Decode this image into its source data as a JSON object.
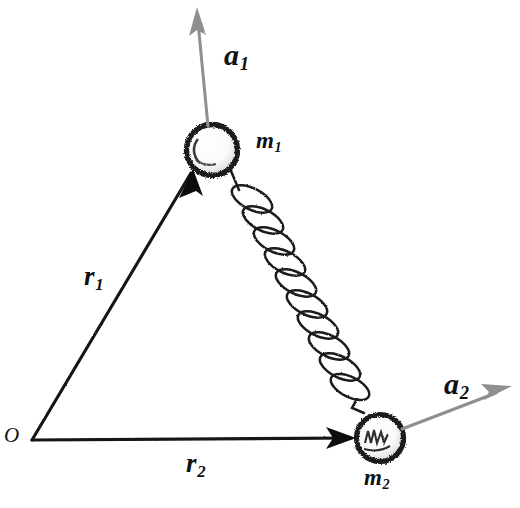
{
  "diagram": {
    "style": "hand-drawn pencil sketch",
    "background_color": "#ffffff",
    "ink_color": "#111111",
    "vector_gray": "#8c8c8c",
    "labels": {
      "origin": "O",
      "mass1": "m",
      "mass1_sub": "1",
      "mass2": "m",
      "mass2_sub": "2",
      "position1": "r",
      "position1_sub": "1",
      "position2": "r",
      "position2_sub": "2",
      "accel1": "a",
      "accel1_sub": "1",
      "accel2": "a",
      "accel2_sub": "2"
    },
    "elements": [
      {
        "name": "origin-point",
        "kind": "point",
        "x": 32,
        "y": 440
      },
      {
        "name": "mass-1-ball",
        "kind": "sphere",
        "cx": 212,
        "cy": 150,
        "r": 27
      },
      {
        "name": "mass-2-ball",
        "kind": "sphere",
        "cx": 380,
        "cy": 438,
        "r": 25
      },
      {
        "name": "position-vector-1",
        "kind": "arrow",
        "from": [
          32,
          440
        ],
        "to": [
          190,
          172
        ],
        "color": "#111111"
      },
      {
        "name": "position-vector-2",
        "kind": "arrow",
        "from": [
          32,
          440
        ],
        "to": [
          356,
          438
        ],
        "color": "#111111"
      },
      {
        "name": "acceleration-vector-1",
        "kind": "arrow",
        "from": [
          208,
          124
        ],
        "to": [
          196,
          8
        ],
        "color": "#8c8c8c"
      },
      {
        "name": "acceleration-vector-2",
        "kind": "arrow",
        "from": [
          402,
          428
        ],
        "to": [
          512,
          385
        ],
        "color": "#8c8c8c"
      },
      {
        "name": "spring-coil",
        "kind": "helix",
        "from": [
          232,
          172
        ],
        "to": [
          364,
          414
        ],
        "coils": 11
      }
    ]
  }
}
